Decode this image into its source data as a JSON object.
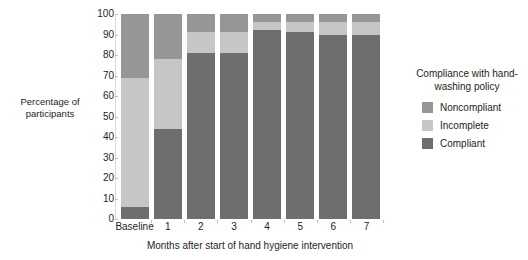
{
  "chart_data": {
    "type": "bar",
    "stacked": true,
    "title": "",
    "xlabel": "Months after start of hand hygiene intervention",
    "ylabel": "Percentage of participants",
    "categories": [
      "Baseline",
      "1",
      "2",
      "3",
      "4",
      "5",
      "6",
      "7"
    ],
    "ylim": [
      0,
      100
    ],
    "yticks": [
      "0",
      "10",
      "20",
      "30",
      "40",
      "50",
      "60",
      "70",
      "80",
      "90",
      "100"
    ],
    "ytick_values": [
      0,
      10,
      20,
      30,
      40,
      50,
      60,
      70,
      80,
      90,
      100
    ],
    "grid": false,
    "legend_position": "right",
    "legend_title": "Compliance with hand-washing policy",
    "series": [
      {
        "name": "Compliant",
        "color": "#6e6e6e",
        "values": [
          6,
          44,
          81,
          81,
          92,
          91,
          90,
          90
        ]
      },
      {
        "name": "Incomplete",
        "color": "#c6c6c6",
        "values": [
          63,
          34,
          10,
          10,
          4,
          5,
          6,
          6
        ]
      },
      {
        "name": "Noncompliant",
        "color": "#969696",
        "values": [
          31,
          22,
          9,
          9,
          4,
          4,
          4,
          4
        ]
      }
    ],
    "legend_order": [
      "Noncompliant",
      "Incomplete",
      "Compliant"
    ]
  },
  "colors": {
    "noncompliant": "#969696",
    "incomplete": "#c6c6c6",
    "compliant": "#6e6e6e",
    "axis": "#d9d9d9",
    "text": "#231f20",
    "background": "#ffffff"
  }
}
